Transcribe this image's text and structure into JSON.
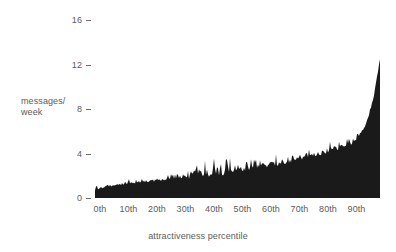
{
  "chart_data": {
    "type": "area",
    "title": "",
    "xlabel": "attractiveness percentile",
    "ylabel": "messages/ week",
    "ylabel_line1": "messages/",
    "ylabel_line2": "week",
    "xlim": [
      0,
      100
    ],
    "ylim": [
      0,
      16
    ],
    "grid": false,
    "legend": null,
    "fill_color": "#1a1a1a",
    "text_color": "#5b5b5b",
    "background_color": "#ffffff",
    "yticks": [
      {
        "value": 16,
        "label": "16"
      },
      {
        "value": 12,
        "label": "12"
      },
      {
        "value": 8,
        "label": "8"
      },
      {
        "value": 4,
        "label": "4"
      },
      {
        "value": 0,
        "label": "0"
      }
    ],
    "xticks": [
      {
        "value": 0,
        "label": "0th"
      },
      {
        "value": 10,
        "label": "10th"
      },
      {
        "value": 20,
        "label": "20th"
      },
      {
        "value": 30,
        "label": "30th"
      },
      {
        "value": 40,
        "label": "40th"
      },
      {
        "value": 50,
        "label": "50th"
      },
      {
        "value": 60,
        "label": "60th"
      },
      {
        "value": 70,
        "label": "70th"
      },
      {
        "value": 80,
        "label": "80th"
      },
      {
        "value": 90,
        "label": "90th"
      }
    ],
    "x": [
      0,
      1,
      2,
      3,
      4,
      5,
      6,
      7,
      8,
      9,
      10,
      11,
      12,
      13,
      14,
      15,
      16,
      17,
      18,
      19,
      20,
      21,
      22,
      23,
      24,
      25,
      26,
      27,
      28,
      29,
      30,
      31,
      32,
      33,
      34,
      35,
      36,
      37,
      38,
      39,
      40,
      41,
      42,
      43,
      44,
      45,
      46,
      47,
      48,
      49,
      50,
      51,
      52,
      53,
      54,
      55,
      56,
      57,
      58,
      59,
      60,
      61,
      62,
      63,
      64,
      65,
      66,
      67,
      68,
      69,
      70,
      71,
      72,
      73,
      74,
      75,
      76,
      77,
      78,
      79,
      80,
      81,
      82,
      83,
      84,
      85,
      86,
      87,
      88,
      89,
      90,
      91,
      92,
      93,
      94,
      95,
      96,
      97,
      98,
      99,
      100
    ],
    "values": [
      0.75,
      0.82,
      0.88,
      0.95,
      1.0,
      1.05,
      1.1,
      1.12,
      1.18,
      1.2,
      1.22,
      1.26,
      1.28,
      1.3,
      1.34,
      1.36,
      1.4,
      1.42,
      1.44,
      1.48,
      1.5,
      1.52,
      1.56,
      1.58,
      1.62,
      1.64,
      1.68,
      1.7,
      1.74,
      1.78,
      1.8,
      1.84,
      1.88,
      1.9,
      1.95,
      2.0,
      2.0,
      2.05,
      2.1,
      2.08,
      2.12,
      2.15,
      2.18,
      2.2,
      2.22,
      2.26,
      2.3,
      2.32,
      2.38,
      2.42,
      2.48,
      2.5,
      2.55,
      2.58,
      2.62,
      2.66,
      2.7,
      2.74,
      2.78,
      2.82,
      2.88,
      2.92,
      2.96,
      3.0,
      3.05,
      3.1,
      3.15,
      3.2,
      3.26,
      3.3,
      3.36,
      3.42,
      3.48,
      3.54,
      3.6,
      3.68,
      3.74,
      3.82,
      3.88,
      3.96,
      4.02,
      4.1,
      4.18,
      4.26,
      4.32,
      4.4,
      4.5,
      4.6,
      4.7,
      4.82,
      4.95,
      5.15,
      5.4,
      5.7,
      6.1,
      6.6,
      7.3,
      8.2,
      9.4,
      10.9,
      12.5
    ],
    "series_name": "messages per week"
  }
}
